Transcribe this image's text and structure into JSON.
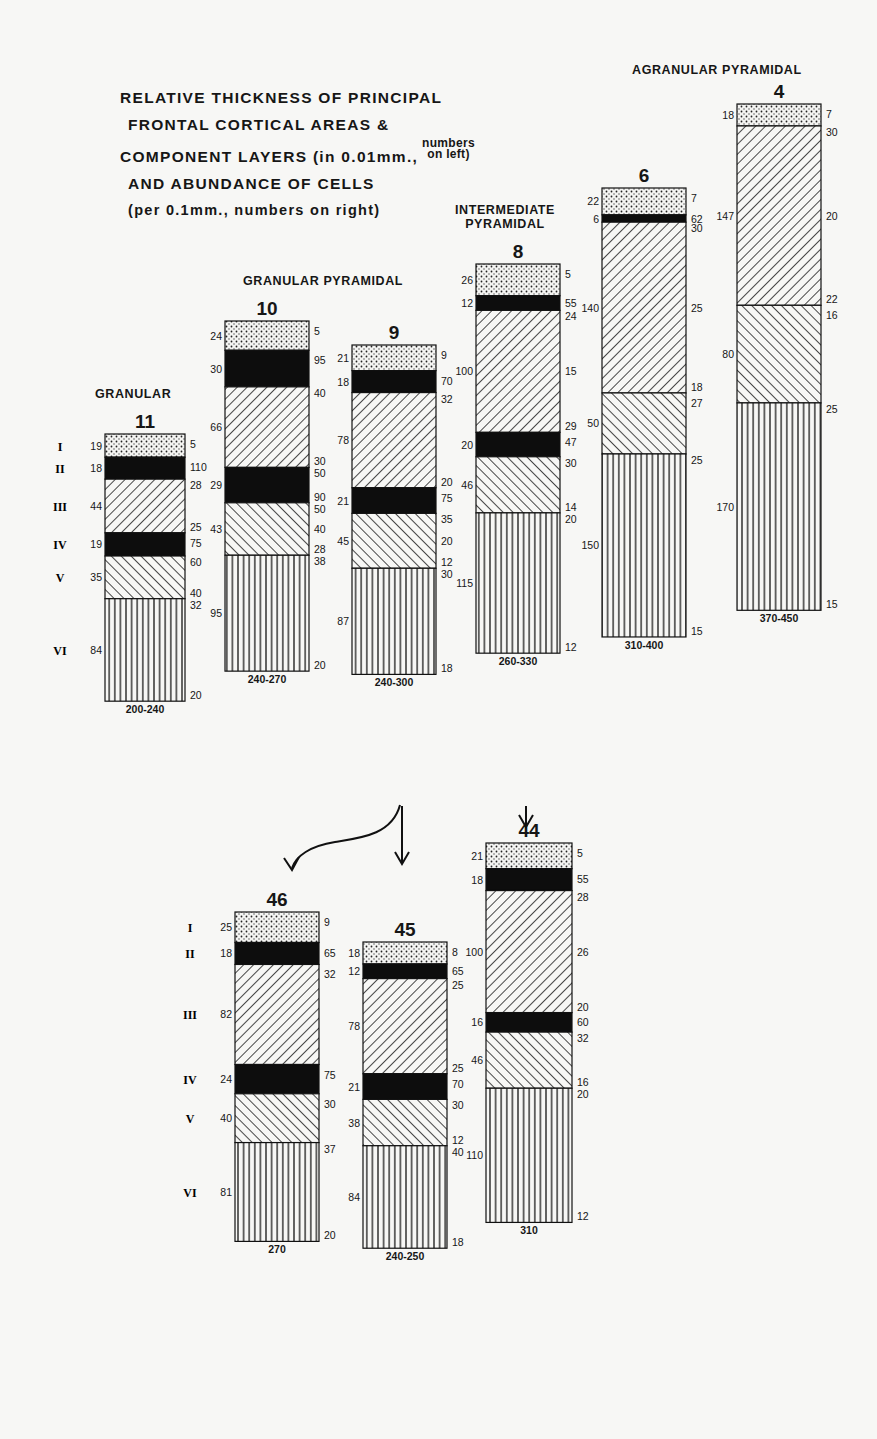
{
  "title": {
    "line1": "RELATIVE THICKNESS OF PRINCIPAL",
    "line2": "FRONTAL CORTICAL AREAS &",
    "line3": "COMPONENT LAYERS (in 0.01mm.,",
    "line3_note_a": "numbers",
    "line3_note_b": "on left)",
    "line4": "AND ABUNDANCE OF CELLS",
    "line5": "(per 0.1mm., numbers on right)"
  },
  "group_labels": {
    "granular": "GRANULAR",
    "granular_pyramidal": "GRANULAR PYRAMIDAL",
    "intermediate_1": "INTERMEDIATE",
    "intermediate_2": "PYRAMIDAL",
    "agranular_pyramidal": "AGRANULAR PYRAMIDAL"
  },
  "layer_roman_numerals": [
    "I",
    "II",
    "III",
    "IV",
    "V",
    "VI"
  ],
  "legend_patterns": {
    "I": "dotted",
    "II": "solid-black",
    "III": "diagonal-forward",
    "IV": "solid-black",
    "V": "diagonal-backward",
    "VI": "vertical-lines"
  },
  "chart_data": {
    "type": "table",
    "units": {
      "thickness": "0.01 mm (left)",
      "cell_abundance": "per 0.1 mm (right)"
    },
    "areas": [
      {
        "area": "11",
        "group": "GRANULAR",
        "total": "200-240",
        "x": 105,
        "top": 434,
        "width": 80,
        "scale": 1.0,
        "layers": [
          {
            "layer": "I",
            "pattern": "dot",
            "thickness": 19,
            "cells": [
              "5"
            ]
          },
          {
            "layer": "II",
            "pattern": "black",
            "thickness": 18,
            "cells": [
              "110"
            ]
          },
          {
            "layer": "III",
            "pattern": "fwd",
            "thickness": 44,
            "cells": [
              "28",
              "25"
            ]
          },
          {
            "layer": "IV",
            "pattern": "black",
            "thickness": 19,
            "cells": [
              "75"
            ]
          },
          {
            "layer": "V",
            "pattern": "back",
            "thickness": 35,
            "cells": [
              "60",
              "40"
            ]
          },
          {
            "layer": "VI",
            "pattern": "vert",
            "thickness": 84,
            "cells": [
              "32",
              "20"
            ]
          }
        ]
      },
      {
        "area": "10",
        "group": "GRANULAR PYRAMIDAL",
        "total": "240-270",
        "x": 225,
        "top": 321,
        "width": 84,
        "scale": 1.0,
        "layers": [
          {
            "layer": "I",
            "pattern": "dot",
            "thickness": 24,
            "cells": [
              "5"
            ]
          },
          {
            "layer": "II",
            "pattern": "black",
            "thickness": 30,
            "cells": [
              "95"
            ]
          },
          {
            "layer": "III",
            "pattern": "fwd",
            "thickness": 66,
            "cells": [
              "40",
              "30"
            ]
          },
          {
            "layer": "IV",
            "pattern": "black",
            "thickness": 29,
            "cells": [
              "50",
              "90"
            ]
          },
          {
            "layer": "V",
            "pattern": "back",
            "thickness": 43,
            "cells": [
              "50",
              "40",
              "28"
            ]
          },
          {
            "layer": "VI",
            "pattern": "vert",
            "thickness": 95,
            "cells": [
              "38",
              "20"
            ]
          }
        ]
      },
      {
        "area": "9",
        "group": "GRANULAR PYRAMIDAL",
        "total": "240-300",
        "x": 352,
        "top": 345,
        "width": 84,
        "scale": 1.0,
        "layers": [
          {
            "layer": "I",
            "pattern": "dot",
            "thickness": 21,
            "cells": [
              "9"
            ]
          },
          {
            "layer": "II",
            "pattern": "black",
            "thickness": 18,
            "cells": [
              "70"
            ]
          },
          {
            "layer": "III",
            "pattern": "fwd",
            "thickness": 78,
            "cells": [
              "32",
              "20"
            ]
          },
          {
            "layer": "IV",
            "pattern": "black",
            "thickness": 21,
            "cells": [
              "75"
            ]
          },
          {
            "layer": "V",
            "pattern": "back",
            "thickness": 45,
            "cells": [
              "35",
              "20",
              "12"
            ]
          },
          {
            "layer": "VI",
            "pattern": "vert",
            "thickness": 87,
            "cells": [
              "30",
              "18"
            ]
          }
        ]
      },
      {
        "area": "8",
        "group": "INTERMEDIATE PYRAMIDAL",
        "total": "260-330",
        "x": 476,
        "top": 264,
        "width": 84,
        "scale": 1.0,
        "layers": [
          {
            "layer": "I",
            "pattern": "dot",
            "thickness": 26,
            "cells": [
              "5"
            ]
          },
          {
            "layer": "II",
            "pattern": "black",
            "thickness": 12,
            "cells": [
              "55"
            ]
          },
          {
            "layer": "III",
            "pattern": "fwd",
            "thickness": 100,
            "cells": [
              "24",
              "15",
              "29"
            ]
          },
          {
            "layer": "IV",
            "pattern": "black",
            "thickness": 20,
            "cells": [
              "47"
            ]
          },
          {
            "layer": "V",
            "pattern": "back",
            "thickness": 46,
            "cells": [
              "30",
              "14"
            ]
          },
          {
            "layer": "VI",
            "pattern": "vert",
            "thickness": 115,
            "cells": [
              "20",
              "12"
            ]
          }
        ]
      },
      {
        "area": "6",
        "group": "AGRANULAR PYRAMIDAL",
        "total": "310-400",
        "x": 602,
        "top": 188,
        "width": 84,
        "scale": 1.0,
        "layers": [
          {
            "layer": "I",
            "pattern": "dot",
            "thickness": 22,
            "cells": [
              "7"
            ]
          },
          {
            "layer": "II",
            "pattern": "black",
            "thickness": 6,
            "cells": [
              "62"
            ]
          },
          {
            "layer": "III",
            "pattern": "fwd",
            "thickness": 140,
            "cells": [
              "30",
              "25",
              "18"
            ]
          },
          {
            "layer": "V",
            "pattern": "back",
            "thickness": 50,
            "cells": [
              "27"
            ]
          },
          {
            "layer": "VI",
            "pattern": "vert",
            "thickness": 150,
            "cells": [
              "25",
              "15"
            ]
          }
        ]
      },
      {
        "area": "4",
        "group": "AGRANULAR PYRAMIDAL",
        "total": "370-450",
        "x": 737,
        "top": 104,
        "width": 84,
        "scale": 1.0,
        "layers": [
          {
            "layer": "I",
            "pattern": "dot",
            "thickness": 18,
            "cells": [
              "7"
            ]
          },
          {
            "layer": "III",
            "pattern": "fwd",
            "thickness": 147,
            "cells": [
              "30",
              "20",
              "22"
            ]
          },
          {
            "layer": "V",
            "pattern": "back",
            "thickness": 80,
            "cells": [
              "16"
            ]
          },
          {
            "layer": "VI",
            "pattern": "vert",
            "thickness": 170,
            "cells": [
              "25",
              "15"
            ]
          }
        ]
      },
      {
        "area": "46",
        "group": "",
        "total": "270",
        "x": 235,
        "top": 912,
        "width": 84,
        "scale": 1.0,
        "layers": [
          {
            "layer": "I",
            "pattern": "dot",
            "thickness": 25,
            "cells": [
              "9"
            ]
          },
          {
            "layer": "II",
            "pattern": "black",
            "thickness": 18,
            "cells": [
              "65"
            ]
          },
          {
            "layer": "III",
            "pattern": "fwd",
            "thickness": 82,
            "cells": [
              "32"
            ]
          },
          {
            "layer": "IV",
            "pattern": "black",
            "thickness": 24,
            "cells": [
              "75"
            ]
          },
          {
            "layer": "V",
            "pattern": "back",
            "thickness": 40,
            "cells": [
              "30"
            ]
          },
          {
            "layer": "VI",
            "pattern": "vert",
            "thickness": 81,
            "cells": [
              "37",
              "20"
            ]
          }
        ]
      },
      {
        "area": "45",
        "group": "",
        "total": "240-250",
        "x": 363,
        "top": 942,
        "width": 84,
        "scale": 1.0,
        "layers": [
          {
            "layer": "I",
            "pattern": "dot",
            "thickness": 18,
            "cells": [
              "8"
            ]
          },
          {
            "layer": "II",
            "pattern": "black",
            "thickness": 12,
            "cells": [
              "65"
            ]
          },
          {
            "layer": "III",
            "pattern": "fwd",
            "thickness": 78,
            "cells": [
              "25",
              "25"
            ]
          },
          {
            "layer": "IV",
            "pattern": "black",
            "thickness": 21,
            "cells": [
              "70"
            ]
          },
          {
            "layer": "V",
            "pattern": "back",
            "thickness": 38,
            "cells": [
              "30",
              "12"
            ]
          },
          {
            "layer": "VI",
            "pattern": "vert",
            "thickness": 84,
            "cells": [
              "40",
              "18"
            ]
          }
        ]
      },
      {
        "area": "44",
        "group": "",
        "total": "310",
        "x": 486,
        "top": 843,
        "width": 86,
        "scale": 1.0,
        "layers": [
          {
            "layer": "I",
            "pattern": "dot",
            "thickness": 21,
            "cells": [
              "5"
            ]
          },
          {
            "layer": "II",
            "pattern": "black",
            "thickness": 18,
            "cells": [
              "55"
            ]
          },
          {
            "layer": "III",
            "pattern": "fwd",
            "thickness": 100,
            "cells": [
              "28",
              "26",
              "20"
            ]
          },
          {
            "layer": "IV",
            "pattern": "black",
            "thickness": 16,
            "cells": [
              "60"
            ]
          },
          {
            "layer": "V",
            "pattern": "back",
            "thickness": 46,
            "cells": [
              "32",
              "16"
            ]
          },
          {
            "layer": "VI",
            "pattern": "vert",
            "thickness": 110,
            "cells": [
              "20",
              "12"
            ]
          }
        ]
      }
    ],
    "roman_numeral_rows": [
      {
        "column": "11",
        "labels": [
          "I",
          "II",
          "III",
          "IV",
          "V",
          "VI"
        ]
      },
      {
        "column": "46",
        "labels": [
          "I",
          "II",
          "III",
          "IV",
          "V",
          "VI"
        ]
      }
    ],
    "arrows": [
      {
        "from": "9",
        "to": "46",
        "style": "curved"
      },
      {
        "from": "9",
        "to": "45",
        "style": "straight"
      },
      {
        "from": "8",
        "to": "44",
        "style": "straight"
      }
    ]
  }
}
